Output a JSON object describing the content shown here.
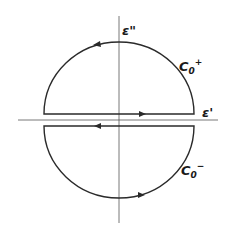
{
  "diagram": {
    "type": "contour-integration-diagram",
    "axes": {
      "horizontal_label": "ε'",
      "vertical_label": "ε\""
    },
    "contours": [
      {
        "name": "C",
        "subscript": "0",
        "superscript": "+",
        "region": "upper half-plane",
        "direction": "counterclockwise"
      },
      {
        "name": "C",
        "subscript": "0",
        "superscript": "−",
        "region": "lower half-plane",
        "direction": "clockwise"
      }
    ],
    "colors": {
      "stroke": "#2a2a2a",
      "axis": "#555555",
      "background": "#ffffff"
    }
  }
}
